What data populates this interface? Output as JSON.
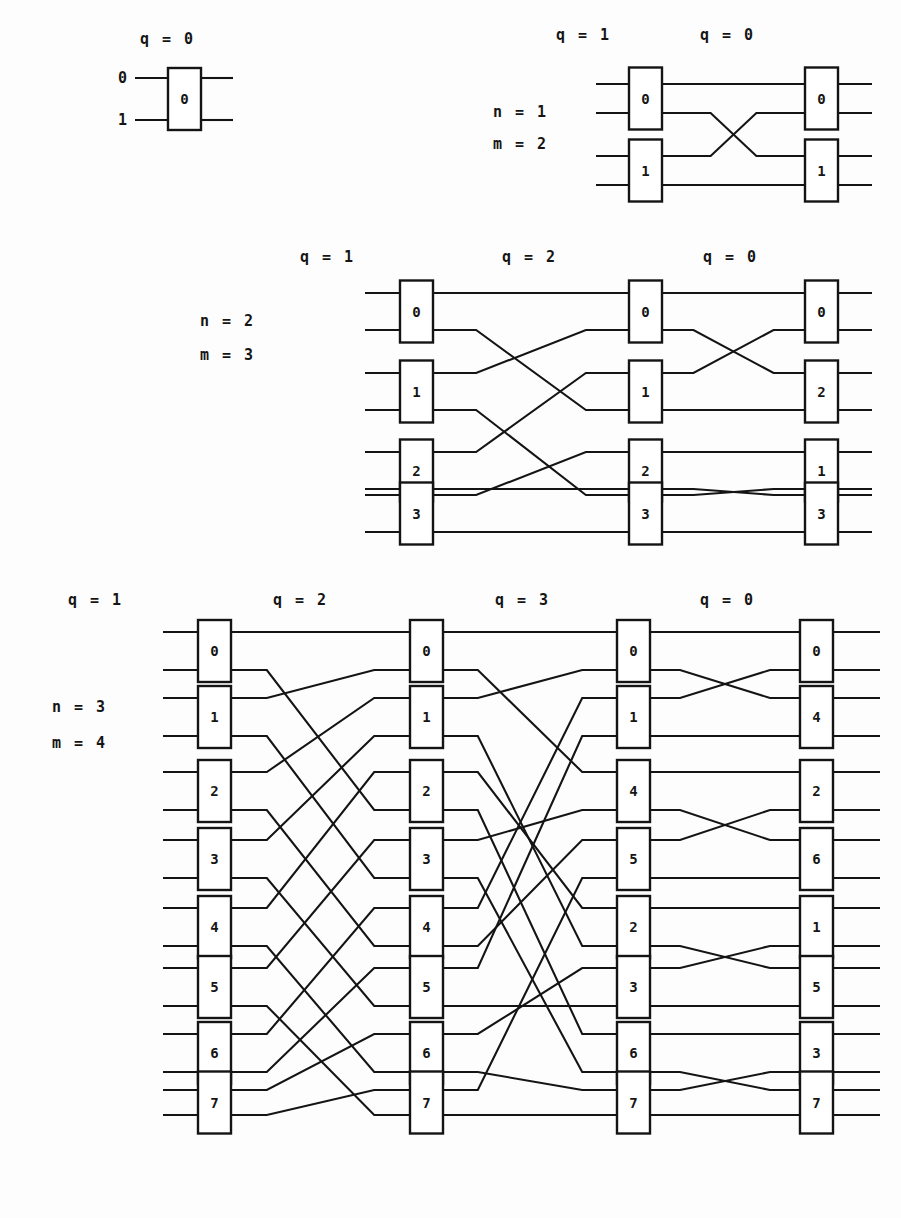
{
  "figure": {
    "colors": {
      "ink": "#141414",
      "paper": "#fdfdfd",
      "box_fill": "#ffffff"
    },
    "diagrams": [
      {
        "id": "diagram-n0-m1",
        "n_label": "",
        "m_label": "",
        "stage_labels": [
          "q = 0"
        ],
        "wire_labels": [
          "0",
          "1"
        ],
        "columns": [
          {
            "stage": "q = 0",
            "boxes": [
              "0"
            ]
          }
        ]
      },
      {
        "id": "diagram-n1-m2",
        "n_label": "n = 1",
        "m_label": "m = 2",
        "stage_labels": [
          "q = 1",
          "q = 0"
        ],
        "wire_labels": [],
        "columns": [
          {
            "stage": "q = 1",
            "boxes": [
              "0",
              "1"
            ]
          },
          {
            "stage": "q = 0",
            "boxes": [
              "0",
              "1"
            ]
          }
        ]
      },
      {
        "id": "diagram-n2-m3",
        "n_label": "n = 2",
        "m_label": "m = 3",
        "stage_labels": [
          "q = 1",
          "q = 2",
          "q = 0"
        ],
        "wire_labels": [],
        "columns": [
          {
            "stage": "q = 1",
            "boxes": [
              "0",
              "1",
              "2",
              "3"
            ]
          },
          {
            "stage": "q = 2",
            "boxes": [
              "0",
              "1",
              "2",
              "3"
            ]
          },
          {
            "stage": "q = 0",
            "boxes": [
              "0",
              "2",
              "1",
              "3"
            ]
          }
        ]
      },
      {
        "id": "diagram-n3-m4",
        "n_label": "n = 3",
        "m_label": "m = 4",
        "stage_labels": [
          "q = 1",
          "q = 2",
          "q = 3",
          "q = 0"
        ],
        "wire_labels": [],
        "columns": [
          {
            "stage": "q = 1",
            "boxes": [
              "0",
              "1",
              "2",
              "3",
              "4",
              "5",
              "6",
              "7"
            ]
          },
          {
            "stage": "q = 2",
            "boxes": [
              "0",
              "1",
              "2",
              "3",
              "4",
              "5",
              "6",
              "7"
            ]
          },
          {
            "stage": "q = 3",
            "boxes": [
              "0",
              "1",
              "4",
              "5",
              "2",
              "3",
              "6",
              "7"
            ]
          },
          {
            "stage": "q = 0",
            "boxes": [
              "0",
              "4",
              "2",
              "6",
              "1",
              "5",
              "3",
              "7"
            ]
          }
        ]
      }
    ]
  },
  "geometry": {
    "d1": {
      "box_x": 168,
      "box_w": 33,
      "box_top": 68,
      "box_h": 62,
      "wire_left": 135,
      "wire_right": 233,
      "rows": [
        78,
        120
      ],
      "qlabel": {
        "x": 140,
        "y": 44
      },
      "wire_label_x": 118
    },
    "d2": {
      "cols": [
        629,
        805
      ],
      "box_w": 33,
      "box_h": 62,
      "wire_left": 596,
      "wire_right": 872,
      "row_pairs": [
        [
          84,
          113
        ],
        [
          156,
          185
        ]
      ],
      "qlabels": [
        {
          "x": 556,
          "y": 40
        },
        {
          "x": 700,
          "y": 40
        }
      ],
      "nm": {
        "x": 493,
        "y": 117,
        "dy": 32
      }
    },
    "d3": {
      "cols": [
        400,
        629,
        805
      ],
      "box_w": 33,
      "box_h": 62,
      "wire_left": 365,
      "wire_right": 872,
      "row_pairs": [
        [
          293,
          330
        ],
        [
          373,
          410
        ],
        [
          452,
          489
        ],
        [
          495,
          532
        ]
      ],
      "qlabels": [
        {
          "x": 300,
          "y": 262
        },
        {
          "x": 502,
          "y": 262
        },
        {
          "x": 703,
          "y": 262
        }
      ],
      "nm": {
        "x": 200,
        "y": 326,
        "dy": 34
      }
    },
    "d4": {
      "cols": [
        198,
        410,
        617,
        800
      ],
      "box_w": 33,
      "box_h": 62,
      "wire_left": 163,
      "wire_right": 880,
      "row_pairs": [
        [
          632,
          670
        ],
        [
          698,
          736
        ],
        [
          772,
          810
        ],
        [
          840,
          878
        ],
        [
          908,
          946
        ],
        [
          968,
          1006
        ],
        [
          1034,
          1072
        ],
        [
          1090,
          1115
        ]
      ],
      "qlabels": [
        {
          "x": 68,
          "y": 605
        },
        {
          "x": 273,
          "y": 605
        },
        {
          "x": 495,
          "y": 605
        },
        {
          "x": 700,
          "y": 605
        }
      ],
      "nm": {
        "x": 52,
        "y": 712,
        "dy": 36
      }
    }
  }
}
